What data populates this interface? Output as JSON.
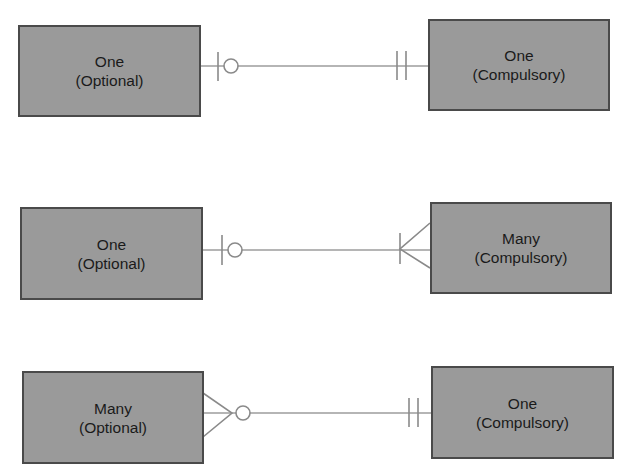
{
  "diagram": {
    "type": "er-cardinality-notation",
    "colors": {
      "entity_fill": "#9a9a9a",
      "entity_border": "#4a4a4a",
      "connector": "#9c9c9c",
      "text": "#1a1a1a"
    },
    "relationships": [
      {
        "left": {
          "line1": "One",
          "line2": "(Optional)",
          "symbol": "zero-or-one"
        },
        "right": {
          "line1": "One",
          "line2": "(Compulsory)",
          "symbol": "exactly-one"
        }
      },
      {
        "left": {
          "line1": "One",
          "line2": "(Optional)",
          "symbol": "zero-or-one"
        },
        "right": {
          "line1": "Many",
          "line2": "(Compulsory)",
          "symbol": "one-or-many"
        }
      },
      {
        "left": {
          "line1": "Many",
          "line2": "(Optional)",
          "symbol": "zero-or-many"
        },
        "right": {
          "line1": "One",
          "line2": "(Compulsory)",
          "symbol": "exactly-one"
        }
      }
    ]
  }
}
